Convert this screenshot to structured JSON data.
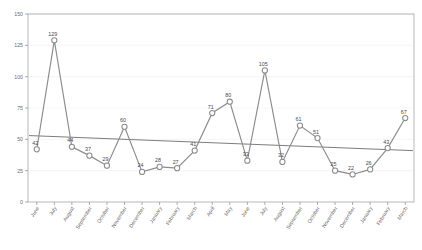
{
  "chart_data": {
    "type": "line",
    "title": "",
    "subtitle": "",
    "xlabel": "",
    "ylabel": "",
    "ylim": [
      0,
      150
    ],
    "yticks": [
      0,
      25,
      50,
      75,
      100,
      125,
      150
    ],
    "grid": true,
    "legend": "none",
    "show_point_labels": true,
    "categories": [
      "June",
      "July",
      "August",
      "September",
      "October",
      "November",
      "December",
      "January",
      "February",
      "March",
      "April",
      "May",
      "June",
      "July",
      "August",
      "September",
      "October",
      "November",
      "December",
      "January",
      "February",
      "March"
    ],
    "series": [
      {
        "name": "Monthly value",
        "marker": "circle-open",
        "color": "#8c8c8c",
        "values": [
          42,
          129,
          44,
          37,
          29,
          60,
          24,
          28,
          27,
          41,
          71,
          80,
          33,
          105,
          32,
          61,
          51,
          25,
          22,
          26,
          43,
          67
        ]
      },
      {
        "name": "Linear trend",
        "type": "trendline",
        "color": "#5a5a5a",
        "start_value": 53,
        "end_value": 41
      }
    ]
  },
  "axes": {
    "y_tick_labels": [
      "0",
      "25",
      "50",
      "75",
      "100",
      "125",
      "150"
    ],
    "x_tick_labels": [
      "June",
      "July",
      "August",
      "September",
      "October",
      "November",
      "December",
      "January",
      "February",
      "March",
      "April",
      "May",
      "June",
      "July",
      "August",
      "September",
      "October",
      "November",
      "December",
      "January",
      "February",
      "March"
    ]
  },
  "point_labels": [
    "42",
    "129",
    "44",
    "37",
    "29",
    "60",
    "24",
    "28",
    "27",
    "41",
    "71",
    "80",
    "33",
    "105",
    "32",
    "61",
    "51",
    "25",
    "22",
    "26",
    "43",
    "67"
  ],
  "colors": {
    "series": "#8c8c8c",
    "trend": "#5a5a5a",
    "grid": "#f0eeec",
    "axis": "#8a8a8a",
    "label_text": "#4a4a4a",
    "tick_text": "#6d6d6d",
    "background": "#ffffff"
  }
}
